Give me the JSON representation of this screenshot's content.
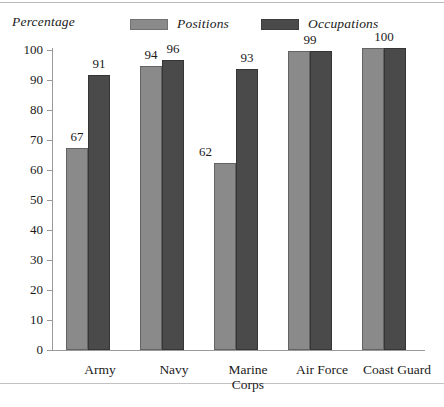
{
  "chart_data": {
    "type": "bar",
    "title": "",
    "subtitle": "",
    "ylabel": "Percentage",
    "xlabel": "",
    "ylim": [
      0,
      100
    ],
    "yticks": [
      0,
      10,
      20,
      30,
      40,
      50,
      60,
      70,
      80,
      90,
      100
    ],
    "grid": false,
    "legend_position": "top-center",
    "categories": [
      "Army",
      "Navy",
      "Marine\nCorps",
      "Air Force",
      "Coast Guard"
    ],
    "series": [
      {
        "name": "Positions",
        "color": "#8a8a8a",
        "values": [
          67,
          94,
          62,
          99,
          100
        ]
      },
      {
        "name": "Occupations",
        "color": "#4a4a4a",
        "values": [
          91,
          96,
          93,
          99,
          100
        ]
      }
    ],
    "data_labels": [
      {
        "category": "Army",
        "positions": "67",
        "occupations": "91",
        "merged": null
      },
      {
        "category": "Navy",
        "positions": "94",
        "occupations": "96",
        "merged": null
      },
      {
        "category": "Marine Corps",
        "positions": "62",
        "occupations": "93",
        "merged": null
      },
      {
        "category": "Air Force",
        "positions": null,
        "occupations": null,
        "merged": "99"
      },
      {
        "category": "Coast Guard",
        "positions": null,
        "occupations": null,
        "merged": "100"
      }
    ]
  },
  "figure": {
    "axis_title": "Percentage",
    "legend": [
      {
        "label": "Positions",
        "color": "#8a8a8a"
      },
      {
        "label": "Occupations",
        "color": "#4a4a4a"
      }
    ],
    "y_tick_labels": [
      "100",
      "90",
      "80",
      "70",
      "60",
      "50",
      "40",
      "30",
      "20",
      "10",
      "0"
    ],
    "categories": [
      {
        "label": "Army"
      },
      {
        "label": "Navy"
      },
      {
        "label": "Marine\nCorps"
      },
      {
        "label": "Air Force"
      },
      {
        "label": "Coast Guard"
      }
    ],
    "values": {
      "army_positions": "67",
      "army_occupations": "91",
      "navy_positions": "94",
      "navy_occupations": "96",
      "marine_positions": "62",
      "marine_occupations": "93",
      "airforce_merged": "99",
      "coastguard_merged": "100"
    }
  }
}
